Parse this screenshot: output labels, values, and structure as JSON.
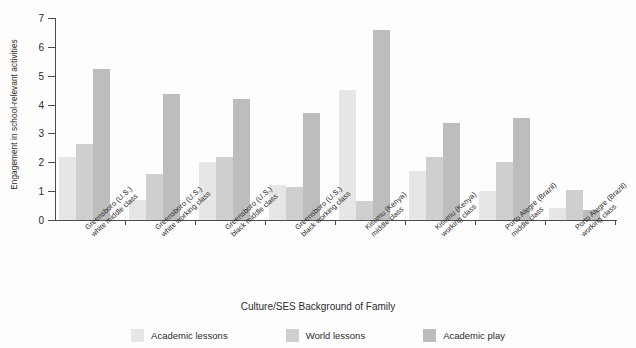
{
  "chart_data": {
    "type": "bar",
    "title": "",
    "xlabel": "Culture/SES Background of Family",
    "ylabel": "Engagement in school-relevant activities",
    "ylim": [
      0,
      7
    ],
    "ytick_labels": [
      "0",
      "1",
      "2",
      "3",
      "4",
      "5",
      "6",
      "7"
    ],
    "grid": false,
    "legend_position": "bottom",
    "categories": [
      "Greensboro (U.S.)\nwhite middle class",
      "Greensboro (U.S.)\nwhite working class",
      "Greensboro (U.S.)\nblack middle class",
      "Greensboro (U.S.)\nblack working class",
      "Kisumu (Kenya)\nmiddle class",
      "Kisumu (Kenya)\nworking class",
      "Porto Alegre (Brazil)\nmiddle class",
      "Porto Alegre (Brazil)\nworking class"
    ],
    "categories_lines": [
      [
        "Greensboro (U.S.)",
        "white middle class"
      ],
      [
        "Greensboro (U.S.)",
        "white working class"
      ],
      [
        "Greensboro (U.S.)",
        "black middle class"
      ],
      [
        "Greensboro (U.S.)",
        "black working class"
      ],
      [
        "Kisumu (Kenya)",
        "middle class"
      ],
      [
        "Kisumu (Kenya)",
        "working class"
      ],
      [
        "Porto Alegre (Brazil)",
        "middle class"
      ],
      [
        "Porto Alegre (Brazil)",
        "working class"
      ]
    ],
    "series": [
      {
        "name": "Academic lessons",
        "color": "#e6e6e6",
        "values": [
          2.2,
          0.7,
          2.0,
          1.2,
          4.5,
          1.7,
          1.0,
          0.4
        ]
      },
      {
        "name": "World lessons",
        "color": "#cfcfcf",
        "values": [
          2.65,
          1.6,
          2.2,
          1.15,
          0.65,
          2.2,
          2.0,
          1.05
        ]
      },
      {
        "name": "Academic play",
        "color": "#bdbdbd",
        "values": [
          5.25,
          4.35,
          4.2,
          3.7,
          6.6,
          3.35,
          3.55,
          0.35
        ]
      }
    ]
  },
  "legend": {
    "items": [
      {
        "label": "Academic lessons",
        "color": "#e6e6e6"
      },
      {
        "label": "World lessons",
        "color": "#cfcfcf"
      },
      {
        "label": "Academic play",
        "color": "#bdbdbd"
      }
    ]
  }
}
